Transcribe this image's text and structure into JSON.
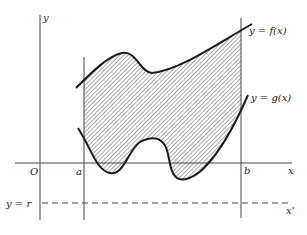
{
  "diagram": {
    "axes": {
      "y_label": "y",
      "x_label": "x",
      "origin_label": "O",
      "shifted_x_label": "x'"
    },
    "bounds": {
      "left_label": "a",
      "right_label": "b"
    },
    "curves": {
      "upper_label": "y = f(x)",
      "lower_label": "y = g(x)"
    },
    "reference_line": {
      "label": "y = r",
      "style": "dashed"
    },
    "region": {
      "fill": "hatched",
      "description": "Region between f(x) and g(x) for a ≤ x ≤ b"
    },
    "colors": {
      "stroke": "#1a1a1a",
      "axis": "#444444",
      "hatch": "#555555",
      "background": "#ffffff"
    }
  }
}
